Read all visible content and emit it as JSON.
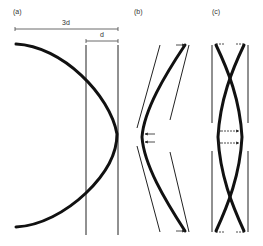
{
  "panels": {
    "a": {
      "label": "(a)",
      "dimension_outer": "3d",
      "dimension_inner": "d"
    },
    "b": {
      "label": "(b)"
    },
    "c": {
      "label": "(c)"
    }
  },
  "colors": {
    "stroke": "#111111",
    "background": "#ffffff"
  }
}
